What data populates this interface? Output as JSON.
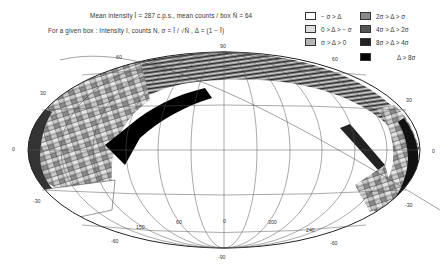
{
  "header": {
    "line1": "Mean intensity  Ī = 287 c.p.s., mean counts / box  N̄ = 64",
    "line2": "For a given box : Intensity   I, counts N,  σ = Ī / √N̄  ,  Δ = (1 − Ī)"
  },
  "legend": {
    "items": [
      {
        "label": "− σ > Δ",
        "color": "#ffffff"
      },
      {
        "label": "0 > Δ > − σ",
        "color": "#dcdcdc"
      },
      {
        "label": "σ > Δ > 0",
        "color": "#b4b4b4"
      },
      {
        "label": "2σ > Δ > σ",
        "color": "#8a8a8a"
      },
      {
        "label": "4σ > Δ > 2σ",
        "color": "#555555"
      },
      {
        "label": "8σ > Δ > 4σ",
        "color": "#222222"
      },
      {
        "label": "Δ > 8σ",
        "color": "#000000"
      }
    ]
  },
  "map": {
    "projection": "Aitoff (galactic coordinates)",
    "latitude_labels": {
      "top": "90",
      "bottom": "-90",
      "left_30": "30",
      "left_60": "60",
      "left_0": "0",
      "left_m30": "-30",
      "left_m60": "-60",
      "right_30": "30",
      "right_60": "60",
      "right_0": "0",
      "right_m30": "-30",
      "right_m60": "-60"
    },
    "longitude_labels": {
      "l150": "150",
      "l60": "60",
      "l0": "0",
      "l300": "300",
      "l240": "240"
    }
  }
}
